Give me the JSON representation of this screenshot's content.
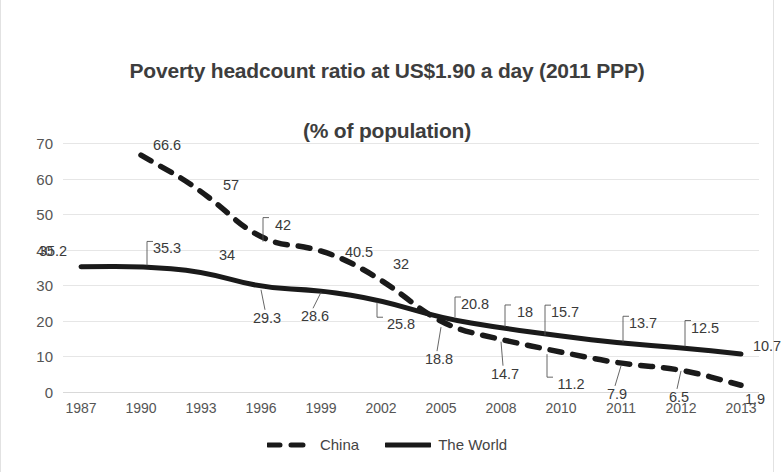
{
  "chart_data": {
    "type": "line",
    "title": "Poverty headcount ratio at US$1.90 a day (2011 PPP)\n(% of population)",
    "title_line1": "Poverty headcount ratio at US$1.90 a day (2011 PPP)",
    "title_line2": "(% of population)",
    "xlabel": "",
    "ylabel": "",
    "ylim": [
      0,
      70
    ],
    "yticks": [
      0,
      10,
      20,
      30,
      40,
      50,
      60,
      70
    ],
    "ytick_labels": [
      "0",
      "10",
      "20",
      "30",
      "40",
      "50",
      "60",
      "70"
    ],
    "grid": true,
    "legend_position": "bottom",
    "categories": [
      "1987",
      "1990",
      "1993",
      "1996",
      "1999",
      "2002",
      "2005",
      "2008",
      "2010",
      "2011",
      "2012",
      "2013"
    ],
    "series": [
      {
        "name": "China",
        "style": "dashed",
        "color": "#1a1a1a",
        "values": [
          null,
          66.6,
          57,
          42,
          40.5,
          32,
          18.8,
          14.7,
          11.2,
          7.9,
          6.5,
          1.9
        ],
        "labels": [
          "",
          "66.6",
          "57",
          "42",
          "40.5",
          "32",
          "18.8",
          "14.7",
          "11.2",
          "7.9",
          "6.5",
          "1.9"
        ]
      },
      {
        "name": "The World",
        "style": "solid",
        "color": "#1a1a1a",
        "values": [
          35.2,
          35.3,
          34,
          29.3,
          28.6,
          25.8,
          20.8,
          18,
          15.7,
          13.7,
          12.5,
          10.7
        ],
        "labels": [
          "35.2",
          "35.3",
          "34",
          "29.3",
          "28.6",
          "25.8",
          "20.8",
          "18",
          "15.7",
          "13.7",
          "12.5",
          "10.7"
        ]
      }
    ]
  },
  "legend": {
    "items": [
      {
        "label": "China",
        "style": "dashed"
      },
      {
        "label": "The World",
        "style": "solid"
      }
    ]
  },
  "colors": {
    "gridline": "#e6e6e6",
    "series": "#1a1a1a",
    "title_text": "#3d3d3d",
    "axis_text": "#555555",
    "data_label_text": "#3a3a3a",
    "background": "#ffffff"
  }
}
